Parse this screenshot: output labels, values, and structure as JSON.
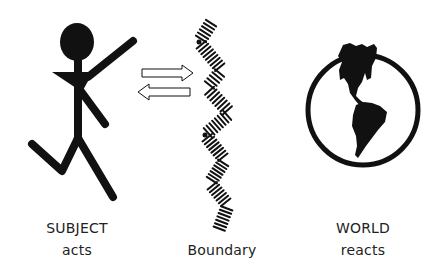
{
  "diagram": {
    "subject": {
      "title": "SUBJECT",
      "subtitle": "acts",
      "icon": "running-stick-figure"
    },
    "boundary": {
      "label": "Boundary",
      "icon": "zigzag-hatched-boundary"
    },
    "world": {
      "title": "WORLD",
      "subtitle": "reacts",
      "icon": "globe-americas"
    },
    "arrows": [
      {
        "direction": "right",
        "from": "subject",
        "to": "world"
      },
      {
        "direction": "left",
        "from": "world",
        "to": "subject"
      }
    ],
    "colors": {
      "ink": "#111111",
      "background": "#ffffff",
      "text": "#222222"
    }
  }
}
